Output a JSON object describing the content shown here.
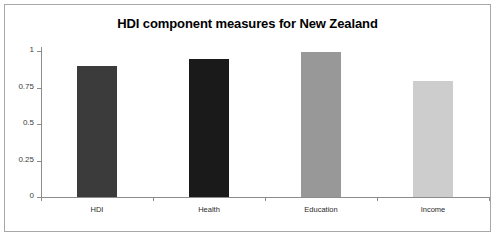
{
  "frame": {
    "border_color": "#a8a8a8",
    "background": "#ffffff"
  },
  "chart_data": {
    "type": "bar",
    "title": "HDI component measures for New Zealand",
    "xlabel": "",
    "ylabel": "",
    "categories": [
      "HDI",
      "Health",
      "Education",
      "Income"
    ],
    "values": [
      0.9,
      0.945,
      0.99,
      0.795
    ],
    "series": [
      {
        "name": "HDI component measures",
        "values": [
          0.9,
          0.945,
          0.99,
          0.795
        ]
      }
    ],
    "bar_colors": [
      "#3b3b3b",
      "#1a1a1a",
      "#989898",
      "#cdcdcd"
    ],
    "ylim": [
      0,
      1
    ],
    "ytick_labels": [
      "0",
      "0.25",
      "0.5",
      "0.75",
      "1"
    ],
    "ytick_values": [
      0,
      0.25,
      0.5,
      0.75,
      1
    ],
    "grid": false,
    "legend": "none",
    "axis_color": "#8c8c8c",
    "text_color": "#2b2b2b"
  }
}
